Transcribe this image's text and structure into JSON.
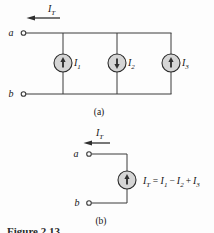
{
  "colors": {
    "wire": "#3b3b3b",
    "source_fill": "#d5d5d5",
    "source_stroke": "#2b2b2b",
    "text": "#141414",
    "background": "#fdfdfd"
  },
  "part_a": {
    "section_label": "(a)",
    "total_current": {
      "base": "I",
      "sub": "T",
      "arrow_direction": "left"
    },
    "node_top": "a",
    "node_bottom": "b",
    "sources": [
      {
        "base": "I",
        "sub": "1",
        "direction": "up"
      },
      {
        "base": "I",
        "sub": "2",
        "direction": "down"
      },
      {
        "base": "I",
        "sub": "3",
        "direction": "up"
      }
    ]
  },
  "part_b": {
    "section_label": "(b)",
    "total_current": {
      "base": "I",
      "sub": "T",
      "arrow_direction": "left"
    },
    "node_top": "a",
    "node_bottom": "b",
    "source": {
      "direction": "up"
    },
    "equation": {
      "lhs_base": "I",
      "lhs_sub": "T",
      "equals": "=",
      "t1_base": "I",
      "t1_sub": "1",
      "op1": "−",
      "t2_base": "I",
      "t2_sub": "2",
      "op2": "+",
      "t3_base": "I",
      "t3_sub": "3"
    }
  },
  "caption": "Figure 2.13"
}
